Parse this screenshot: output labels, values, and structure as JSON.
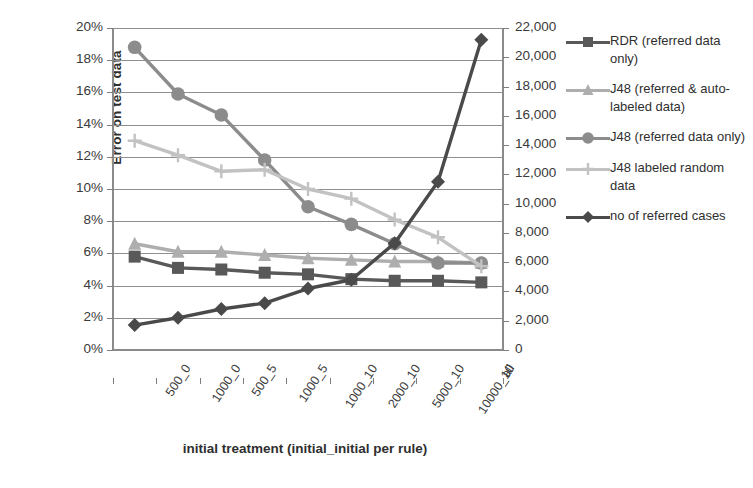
{
  "chart_data": {
    "type": "line",
    "title": "",
    "xlabel": "initial treatment (initial_initial per rule)",
    "ylabel": "Error on test data",
    "ylabel_right": "",
    "categories": [
      "500_0",
      "1000_0",
      "500_5",
      "1000_5",
      "1000_10",
      "2000_10",
      "5000_10",
      "10000_10",
      "all"
    ],
    "ylim": [
      0,
      20
    ],
    "yticks": [
      "0%",
      "2%",
      "4%",
      "6%",
      "8%",
      "10%",
      "12%",
      "14%",
      "16%",
      "18%",
      "20%"
    ],
    "ylim_right": [
      0,
      22000
    ],
    "yticks_right": [
      "0",
      "2,000",
      "4,000",
      "6,000",
      "8,000",
      "10,000",
      "12,000",
      "14,000",
      "16,000",
      "18,000",
      "20,000",
      "22,000"
    ],
    "grid": true,
    "legend_position": "right",
    "series": [
      {
        "name": "RDR (referred data only)",
        "axis": "left",
        "marker": "square",
        "color": "#595959",
        "values": [
          5.8,
          5.1,
          5.0,
          4.8,
          4.7,
          4.4,
          4.3,
          4.3,
          4.2
        ]
      },
      {
        "name": "J48 (referred & auto-labeled data)",
        "axis": "left",
        "marker": "triangle",
        "color": "#aeaeae",
        "values": [
          6.6,
          6.1,
          6.1,
          5.9,
          5.7,
          5.6,
          5.5,
          5.5,
          5.4
        ]
      },
      {
        "name": "J48 (referred data only)",
        "axis": "left",
        "marker": "circle",
        "color": "#8c8c8c",
        "values": [
          18.8,
          15.9,
          14.6,
          11.8,
          8.9,
          7.8,
          6.6,
          5.4,
          5.4
        ]
      },
      {
        "name": "J48 labeled random data",
        "axis": "left",
        "marker": "plus",
        "color": "#c2c2c2",
        "values": [
          13.0,
          12.1,
          11.1,
          11.2,
          10.0,
          9.4,
          8.1,
          7.0,
          5.2
        ]
      },
      {
        "name": "no of referred cases",
        "axis": "right",
        "marker": "diamond",
        "color": "#4a4a4a",
        "values": [
          1700,
          2200,
          2800,
          3200,
          4200,
          4800,
          7300,
          11500,
          21200
        ]
      }
    ]
  },
  "legend": {
    "entries": [
      {
        "label": "RDR (referred data only)",
        "marker": "square-marker",
        "color": "#595959"
      },
      {
        "label": "J48 (referred & auto-labeled data)",
        "marker": "triangle-marker",
        "color": "#aeaeae"
      },
      {
        "label": "J48 (referred data only)",
        "marker": "circle-marker",
        "color": "#8c8c8c"
      },
      {
        "label": "J48 labeled random data",
        "marker": "plus-marker",
        "color": "#c2c2c2"
      },
      {
        "label": "no of referred cases",
        "marker": "diamond-marker",
        "color": "#4a4a4a"
      }
    ]
  },
  "colors": {
    "grid": "#8f8f8f",
    "axis": "#8a8a8a",
    "text": "#3a3a3a",
    "background": "#ffffff"
  }
}
